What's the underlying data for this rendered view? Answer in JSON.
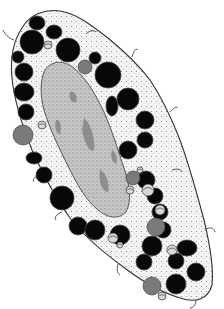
{
  "image": {
    "subject": "Electron-micrograph-style line drawing of a granulocyte cell",
    "description": "Elongated cell with a central mottled nucleus surrounded by cytoplasm packed with dark round granules, a few grey granules and small mitochondria",
    "colors": {
      "background": "#ffffff",
      "cytoplasm": "#f4f4f2",
      "outline": "#333333",
      "granule_dark": "#080808",
      "granule_grey": "#7a7a7a",
      "nucleus": "#b9b9b9",
      "nucleus_dark": "#7d7d7d"
    },
    "parts": {
      "cell_membrane": "cell membrane",
      "nucleus": "nucleus",
      "granules_dark": "dense secretory granules",
      "granules_grey": "grey granules",
      "mitochondria": "mitochondria"
    }
  }
}
